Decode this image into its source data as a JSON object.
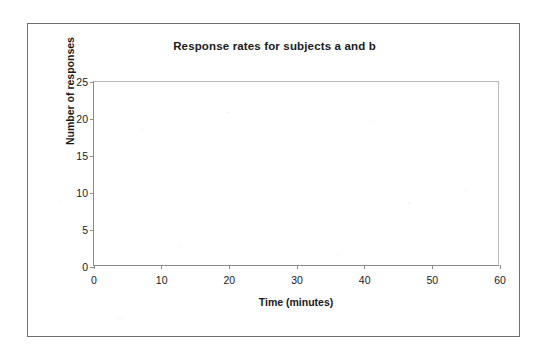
{
  "figure": {
    "title": "Response rates for subjects a and b",
    "frame_color": "#6f6f6f",
    "background": "#ffffff"
  },
  "chart_data": {
    "type": "line",
    "title": "Response rates for subjects a and b",
    "subtitle": "",
    "xlabel": "Time (minutes)",
    "ylabel": "Number of responses",
    "xlim": [
      0,
      60
    ],
    "ylim": [
      0,
      25
    ],
    "x_ticks": [
      0,
      10,
      20,
      30,
      40,
      50,
      60
    ],
    "y_ticks": [
      0,
      5,
      10,
      15,
      20,
      25
    ],
    "x_tick_labels": [
      "0",
      "10",
      "20",
      "30",
      "40",
      "50",
      "60"
    ],
    "y_tick_labels": [
      "0",
      "5",
      "10",
      "15",
      "20",
      "25"
    ],
    "grid": false,
    "legend": false,
    "legend_position": "none",
    "series": [
      {
        "name": "subject a",
        "x": [],
        "values": []
      },
      {
        "name": "subject b",
        "x": [],
        "values": []
      }
    ],
    "annotations": [],
    "note": "Empty plotting grid — axes drawn with no data points plotted."
  }
}
